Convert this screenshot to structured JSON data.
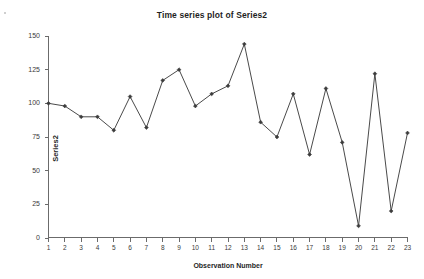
{
  "chart_data": {
    "type": "line",
    "title": "Time series plot of Series2",
    "xlabel": "Observation Number",
    "ylabel": "Series2",
    "x": [
      1,
      2,
      3,
      4,
      5,
      6,
      7,
      8,
      9,
      10,
      11,
      12,
      13,
      14,
      15,
      16,
      17,
      18,
      19,
      20,
      21,
      22,
      23
    ],
    "values": [
      100,
      98,
      90,
      90,
      80,
      105,
      82,
      117,
      125,
      98,
      107,
      113,
      144,
      86,
      75,
      107,
      62,
      111,
      71,
      9,
      122,
      20,
      78
    ],
    "series": [
      {
        "name": "Series2",
        "values": [
          100,
          98,
          90,
          90,
          80,
          105,
          82,
          117,
          125,
          98,
          107,
          113,
          144,
          86,
          75,
          107,
          62,
          111,
          71,
          9,
          122,
          20,
          78
        ]
      }
    ],
    "xtick_labels": [
      "1",
      "2",
      "3",
      "4",
      "5",
      "6",
      "7",
      "8",
      "9",
      "10",
      "11",
      "12",
      "13",
      "14",
      "15",
      "16",
      "17",
      "18",
      "19",
      "20",
      "21",
      "22",
      "23"
    ],
    "ytick_labels": [
      "0",
      "25",
      "50",
      "75",
      "100",
      "125",
      "150"
    ],
    "yticks": [
      0,
      25,
      50,
      75,
      100,
      125,
      150
    ],
    "ylim": [
      0,
      150
    ],
    "xlim": [
      1,
      23
    ],
    "grid": false,
    "legend": false,
    "legend_position": "none",
    "line_color": "#4a4a4a",
    "marker_color": "#3c3c3c",
    "marker": "diamond",
    "background_color": "#ffffff"
  }
}
